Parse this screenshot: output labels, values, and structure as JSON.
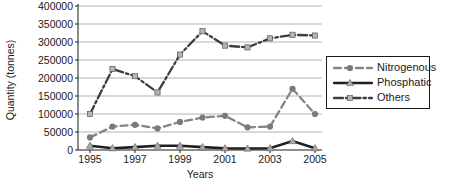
{
  "chart_data": {
    "type": "line",
    "title": "",
    "xlabel": "Years",
    "ylabel": "Quantity (tonnes)",
    "x": [
      1995,
      1996,
      1997,
      1998,
      1999,
      2000,
      2001,
      2002,
      2003,
      2004,
      2005
    ],
    "xtick_labels": [
      "1995",
      "1997",
      "1999",
      "2001",
      "2003",
      "2005"
    ],
    "xtick_years": [
      1995,
      1997,
      1999,
      2001,
      2003,
      2005
    ],
    "ylim": [
      0,
      400000
    ],
    "ytick_step": 50000,
    "grid": true,
    "legend_position": "right",
    "colors": {
      "grid": "#b3b3b3",
      "axis": "#1a1a1a",
      "nitrogenous": "#858585",
      "phosphatic": "#1f1f1f",
      "others": "#3d3d3d"
    },
    "series": [
      {
        "name": "Nitrogenous",
        "style": "dashed",
        "marker": "circle",
        "color": "#858585",
        "marker_color": "#7a7a7a",
        "values": [
          35000,
          65000,
          70000,
          60000,
          78000,
          90000,
          95000,
          63000,
          65000,
          170000,
          100000
        ]
      },
      {
        "name": "Phosphatic",
        "style": "solid",
        "marker": "triangle",
        "color": "#1f1f1f",
        "marker_color": "#ababab",
        "values": [
          12000,
          5000,
          8000,
          12000,
          12000,
          8000,
          5000,
          4000,
          5000,
          25000,
          5000
        ]
      },
      {
        "name": "Others",
        "style": "dashdot",
        "marker": "square",
        "color": "#3d3d3d",
        "marker_color": "#b5b5b5",
        "values": [
          100000,
          225000,
          205000,
          160000,
          265000,
          330000,
          290000,
          285000,
          310000,
          320000,
          318000
        ]
      }
    ]
  }
}
